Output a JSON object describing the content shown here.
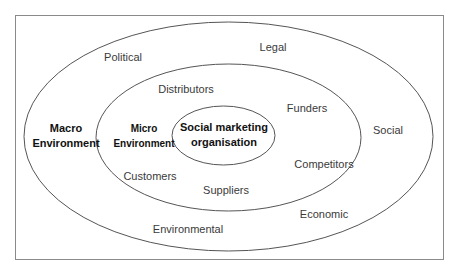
{
  "diagram": {
    "type": "nested-ellipses",
    "colors": {
      "stroke": "#555555",
      "frame": "#8a8a8a",
      "text": "#3a3a3a",
      "bold_text": "#111111"
    },
    "rings": {
      "macro": {
        "label_line1": "Macro",
        "label_line2": "Environment",
        "factors": {
          "political": "Political",
          "legal": "Legal",
          "social": "Social",
          "economic": "Economic",
          "environmental": "Environmental"
        }
      },
      "micro": {
        "label_line1": "Micro",
        "label_line2": "Environment",
        "factors": {
          "distributors": "Distributors",
          "funders": "Funders",
          "competitors": "Competitors",
          "suppliers": "Suppliers",
          "customers": "Customers"
        }
      },
      "core": {
        "label_line1": "Social marketing",
        "label_line2": "organisation"
      }
    }
  }
}
